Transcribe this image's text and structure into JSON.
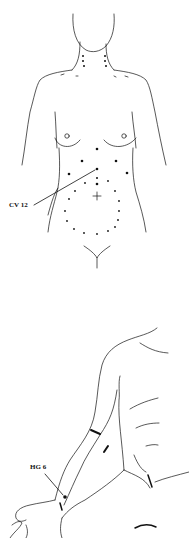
{
  "figures": [
    {
      "name": "torso-front",
      "point_label": "CV 12"
    },
    {
      "name": "arm-side",
      "point_label": "HG 6"
    }
  ],
  "colors": {
    "line": "#111111",
    "background": "#ffffff"
  }
}
